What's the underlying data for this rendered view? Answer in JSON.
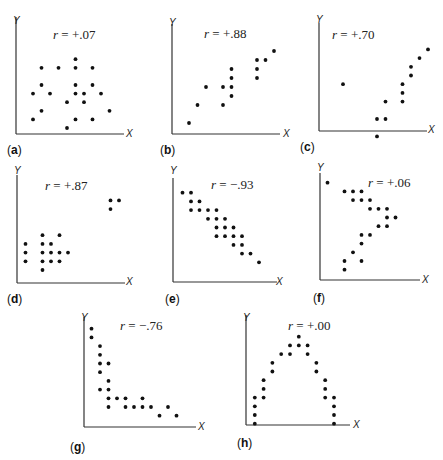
{
  "chart_data": [
    {
      "type": "scatter",
      "panel": "a",
      "title": "r = +.07",
      "r_sign": "+",
      "r_value": ".07",
      "xlabel": "X",
      "ylabel": "Y",
      "points": [
        [
          7,
          2
        ],
        [
          3,
          3
        ],
        [
          5,
          3
        ],
        [
          7,
          3
        ],
        [
          9,
          3
        ],
        [
          3,
          5
        ],
        [
          7,
          5
        ],
        [
          9,
          5
        ],
        [
          2,
          6
        ],
        [
          4,
          6
        ],
        [
          7,
          6
        ],
        [
          8,
          6
        ],
        [
          10,
          6
        ],
        [
          6,
          7
        ],
        [
          8,
          7
        ],
        [
          3,
          8
        ],
        [
          11,
          8
        ],
        [
          2,
          9
        ],
        [
          7,
          9
        ],
        [
          9,
          9
        ],
        [
          6,
          10
        ]
      ]
    },
    {
      "type": "scatter",
      "panel": "b",
      "title": "r = +.88",
      "r_sign": "+",
      "r_value": ".88",
      "xlabel": "X",
      "ylabel": "Y",
      "points": [
        [
          12,
          2
        ],
        [
          10,
          3
        ],
        [
          11,
          3
        ],
        [
          7,
          4
        ],
        [
          10,
          4
        ],
        [
          7,
          5
        ],
        [
          10,
          5
        ],
        [
          4,
          6
        ],
        [
          6,
          6
        ],
        [
          7,
          6
        ],
        [
          7,
          7
        ],
        [
          3,
          8
        ],
        [
          6,
          8
        ],
        [
          2,
          10
        ]
      ]
    },
    {
      "type": "scatter",
      "panel": "c",
      "title": "r = +.70",
      "r_sign": "+",
      "r_value": ".70",
      "xlabel": "X",
      "ylabel": "Y",
      "points": [
        [
          12,
          2
        ],
        [
          11,
          3
        ],
        [
          10,
          4
        ],
        [
          10,
          5
        ],
        [
          2,
          6
        ],
        [
          9,
          6
        ],
        [
          9,
          7
        ],
        [
          7,
          8
        ],
        [
          9,
          8
        ],
        [
          6,
          10
        ],
        [
          7,
          10
        ],
        [
          6,
          12
        ]
      ]
    },
    {
      "type": "scatter",
      "panel": "d",
      "title": "r = +.87",
      "r_sign": "+",
      "r_value": ".87",
      "xlabel": "X",
      "ylabel": "Y",
      "points": [
        [
          11,
          2
        ],
        [
          12,
          2
        ],
        [
          11,
          3
        ],
        [
          3,
          6
        ],
        [
          5,
          6
        ],
        [
          1,
          7
        ],
        [
          3,
          7
        ],
        [
          4,
          7
        ],
        [
          1,
          8
        ],
        [
          3,
          8
        ],
        [
          4,
          8
        ],
        [
          5,
          8
        ],
        [
          6,
          8
        ],
        [
          1,
          9
        ],
        [
          3,
          9
        ],
        [
          4,
          9
        ],
        [
          5,
          9
        ],
        [
          3,
          10
        ]
      ]
    },
    {
      "type": "scatter",
      "panel": "e",
      "title": "r = -.93",
      "r_sign": "−",
      "r_value": ".93",
      "xlabel": "X",
      "ylabel": "Y",
      "points": [
        [
          1,
          1
        ],
        [
          2,
          1
        ],
        [
          2,
          2
        ],
        [
          3,
          2
        ],
        [
          2,
          3
        ],
        [
          3,
          3
        ],
        [
          4,
          3
        ],
        [
          5,
          3
        ],
        [
          4,
          4
        ],
        [
          5,
          4
        ],
        [
          6,
          4
        ],
        [
          5,
          5
        ],
        [
          6,
          5
        ],
        [
          7,
          5
        ],
        [
          5,
          6
        ],
        [
          6,
          6
        ],
        [
          7,
          6
        ],
        [
          8,
          6
        ],
        [
          7,
          7
        ],
        [
          8,
          7
        ],
        [
          8,
          8
        ],
        [
          9,
          8
        ],
        [
          10,
          9
        ]
      ]
    },
    {
      "type": "scatter",
      "panel": "f",
      "title": "r = +.06",
      "r_sign": "+",
      "r_value": ".06",
      "xlabel": "X",
      "ylabel": "Y",
      "points": [
        [
          1,
          1
        ],
        [
          3,
          2
        ],
        [
          4,
          2
        ],
        [
          5,
          2
        ],
        [
          4,
          3
        ],
        [
          5,
          3
        ],
        [
          6,
          3
        ],
        [
          6,
          4
        ],
        [
          7,
          4
        ],
        [
          8,
          4
        ],
        [
          8,
          5
        ],
        [
          9,
          5
        ],
        [
          7,
          6
        ],
        [
          8,
          6
        ],
        [
          5,
          7
        ],
        [
          6,
          7
        ],
        [
          5,
          8
        ],
        [
          4,
          9
        ],
        [
          3,
          10
        ],
        [
          5,
          10
        ],
        [
          3,
          11
        ]
      ]
    },
    {
      "type": "scatter",
      "panel": "g",
      "title": "r = -.76",
      "r_sign": "−",
      "r_value": ".76",
      "xlabel": "X",
      "ylabel": "Y",
      "points": [
        [
          1,
          1
        ],
        [
          1,
          2
        ],
        [
          2,
          3
        ],
        [
          2,
          4
        ],
        [
          2,
          5
        ],
        [
          3,
          5
        ],
        [
          2,
          6
        ],
        [
          3,
          7
        ],
        [
          2,
          8
        ],
        [
          3,
          8
        ],
        [
          3,
          9
        ],
        [
          4,
          9
        ],
        [
          5,
          9
        ],
        [
          7,
          9
        ],
        [
          3,
          10
        ],
        [
          5,
          10
        ],
        [
          6,
          10
        ],
        [
          7,
          10
        ],
        [
          8,
          10
        ],
        [
          10,
          10
        ],
        [
          9,
          11
        ],
        [
          11,
          11
        ]
      ]
    },
    {
      "type": "scatter",
      "panel": "h",
      "title": "r = +.00",
      "r_sign": "+",
      "r_value": ".00",
      "xlabel": "X",
      "ylabel": "Y",
      "points": [
        [
          6,
          1
        ],
        [
          5,
          2
        ],
        [
          6,
          2
        ],
        [
          7,
          2
        ],
        [
          4,
          3
        ],
        [
          5,
          3
        ],
        [
          7,
          3
        ],
        [
          3,
          4
        ],
        [
          8,
          4
        ],
        [
          3,
          5
        ],
        [
          8,
          5
        ],
        [
          2,
          6
        ],
        [
          9,
          6
        ],
        [
          2,
          7
        ],
        [
          9,
          7
        ],
        [
          1,
          8
        ],
        [
          2,
          8
        ],
        [
          9,
          8
        ],
        [
          10,
          8
        ],
        [
          1,
          9
        ],
        [
          10,
          9
        ],
        [
          1,
          10
        ],
        [
          10,
          10
        ],
        [
          1,
          11
        ],
        [
          10,
          11
        ]
      ]
    }
  ],
  "panels": {
    "a": {
      "letter": "a",
      "r_text": " = +.07"
    },
    "b": {
      "letter": "b",
      "r_text": " = +.88"
    },
    "c": {
      "letter": "c",
      "r_text": " = +.70"
    },
    "d": {
      "letter": "d",
      "r_text": " = +.87"
    },
    "e": {
      "letter": "e",
      "r_text": " = −.93"
    },
    "f": {
      "letter": "f",
      "r_text": " = +.06"
    },
    "g": {
      "letter": "g",
      "r_text": " = −.76"
    },
    "h": {
      "letter": "h",
      "r_text": " = +.00"
    }
  },
  "axis": {
    "x": "X",
    "y": "Y",
    "r": "r"
  }
}
